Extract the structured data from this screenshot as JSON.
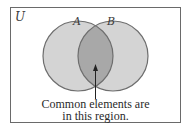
{
  "diagram": {
    "type": "venn",
    "universe_label": "U",
    "sets": [
      {
        "label": "A",
        "cx": 78,
        "cy": 56,
        "r": 35
      },
      {
        "label": "B",
        "cx": 113,
        "cy": 56,
        "r": 35
      }
    ],
    "highlight": "A∩B",
    "caption_line1": "Common elements are",
    "caption_line2": "in this region.",
    "colors": {
      "set_fill": "#d4d4d4",
      "overlap_fill": "#a8a8a8",
      "outline": "#6e6e6e",
      "frame": "#6a6a6a",
      "arrow": "#222222"
    }
  }
}
